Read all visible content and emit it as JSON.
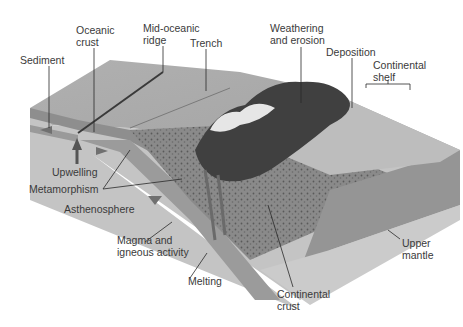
{
  "diagram": {
    "type": "geologic-block-diagram",
    "colors": {
      "background": "#ffffff",
      "label_text": "#3a3a3a",
      "leader_line": "#2a2a2a",
      "ocean_surface": "#a9a9a9",
      "front_face": "#b8b8b8",
      "upper_mantle": "#8f8f8f",
      "mantle_base": "#c6c6c6",
      "continental_crust": "#7d7d7d",
      "mountains": "#3c3c3c"
    },
    "labels": {
      "sediment": "Sediment",
      "oceanic_crust": "Oceanic\ncrust",
      "mid_oceanic_ridge": "Mid-oceanic\nridge",
      "trench": "Trench",
      "weathering": "Weathering\nand erosion",
      "deposition": "Deposition",
      "continental_shelf": "Continental\nshelf",
      "upwelling": "Upwelling",
      "metamorphism": "Metamorphism",
      "asthenosphere": "Asthenosphere",
      "magma": "Magma and\nigneous activity",
      "melting": "Melting",
      "continental_crust": "Continental\ncrust",
      "upper_mantle": "Upper\nmantle"
    }
  }
}
